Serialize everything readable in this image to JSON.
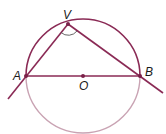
{
  "diagram": {
    "points": {
      "V": {
        "label": "V"
      },
      "A": {
        "label": "A"
      },
      "B": {
        "label": "B"
      },
      "O": {
        "label": "O"
      }
    },
    "colors": {
      "upper_arc": "#8a2a55",
      "lower_arc": "#c9a3b3",
      "segments": "#8a2a55",
      "points": "#7a2048",
      "angle_mark": "#555555",
      "labels": "#1a1a1a"
    },
    "elements": [
      "circle centered at O",
      "diameter AB",
      "chord VA extended",
      "chord VB extended",
      "angle mark at V"
    ]
  }
}
